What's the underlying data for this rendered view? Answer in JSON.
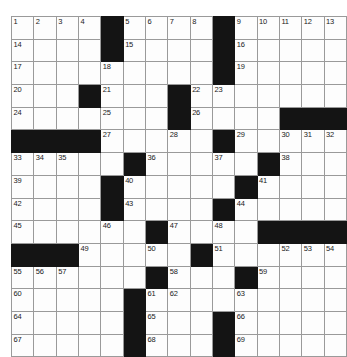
{
  "puzzle": {
    "name": "crossword-grid",
    "rows": 15,
    "cols": 15,
    "colors": {
      "block": "#141414",
      "cell": "#fdfdfd",
      "gridline": "#9a9a9a",
      "number": "#1a1a1a",
      "page_background": "#ffffff"
    },
    "grid": [
      [
        "1",
        "2",
        "3",
        "4",
        "#",
        "5",
        "6",
        "7",
        "8",
        "#",
        "9",
        "10",
        "11",
        "12",
        "13"
      ],
      [
        "14",
        "",
        "",
        "",
        "#",
        "15",
        "",
        "",
        "",
        "#",
        "16",
        "",
        "",
        "",
        ""
      ],
      [
        "17",
        "",
        "",
        "",
        "18",
        "",
        "",
        "",
        "",
        "#",
        "19",
        "",
        "",
        "",
        ""
      ],
      [
        "20",
        "",
        "",
        "#",
        "21",
        "",
        "",
        "#",
        "22",
        "23",
        "",
        "",
        "",
        "",
        ""
      ],
      [
        "24",
        "",
        "",
        "",
        "25",
        "",
        "",
        "#",
        "26",
        "",
        "",
        "",
        "#",
        "#",
        "#"
      ],
      [
        "#",
        "#",
        "#",
        "#",
        "27",
        "",
        "",
        "28",
        "",
        "#",
        "29",
        "",
        "30",
        "31",
        "32"
      ],
      [
        "33",
        "34",
        "35",
        "",
        "",
        "#",
        "36",
        "",
        "",
        "37",
        "",
        "#",
        "38",
        "",
        ""
      ],
      [
        "39",
        "",
        "",
        "",
        "#",
        "40",
        "",
        "",
        "",
        "",
        "#",
        "41",
        "",
        "",
        ""
      ],
      [
        "42",
        "",
        "",
        "",
        "#",
        "43",
        "",
        "",
        "",
        "#",
        "44",
        "",
        "",
        "",
        ""
      ],
      [
        "45",
        "",
        "",
        "",
        "46",
        "",
        "#",
        "47",
        "",
        "48",
        "",
        "#",
        "#",
        "#",
        "#"
      ],
      [
        "#",
        "#",
        "#",
        "49",
        "",
        "",
        "50",
        "",
        "#",
        "51",
        "",
        "",
        "52",
        "53",
        "54"
      ],
      [
        "55",
        "56",
        "57",
        "",
        "",
        "",
        "#",
        "58",
        "",
        "",
        "#",
        "59",
        "",
        "",
        ""
      ],
      [
        "60",
        "",
        "",
        "",
        "",
        "#",
        "61",
        "62",
        "",
        "",
        "63",
        "",
        "",
        "",
        ""
      ],
      [
        "64",
        "",
        "",
        "",
        "",
        "#",
        "65",
        "",
        "",
        "#",
        "66",
        "",
        "",
        "",
        ""
      ],
      [
        "67",
        "",
        "",
        "",
        "",
        "#",
        "68",
        "",
        "",
        "#",
        "69",
        "",
        "",
        "",
        ""
      ]
    ]
  }
}
